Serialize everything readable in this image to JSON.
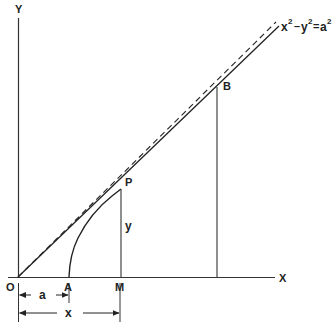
{
  "figure": {
    "axes": {
      "x_label": "X",
      "y_label": "Y",
      "origin_label": "O"
    },
    "points": {
      "A": "A",
      "M": "M",
      "P": "P",
      "B": "B"
    },
    "segment_labels": {
      "PM": "y",
      "OA": "a",
      "OM": "x"
    },
    "curve_equation": {
      "x": "x",
      "minus": "–",
      "y": "y",
      "equals": "=",
      "a": "a",
      "exp": "2"
    },
    "colors": {
      "line": "#222222",
      "background": "#ffffff"
    }
  }
}
